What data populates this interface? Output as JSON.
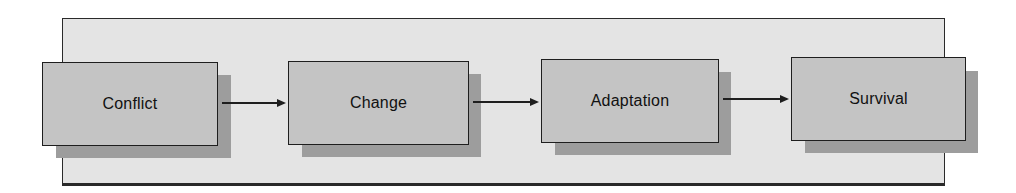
{
  "diagram": {
    "type": "flow",
    "direction": "left-to-right",
    "nodes": [
      {
        "id": "conflict",
        "label": "Conflict"
      },
      {
        "id": "change",
        "label": "Change"
      },
      {
        "id": "adaptation",
        "label": "Adaptation"
      },
      {
        "id": "survival",
        "label": "Survival"
      }
    ],
    "edges": [
      {
        "from": "conflict",
        "to": "change"
      },
      {
        "from": "change",
        "to": "adaptation"
      },
      {
        "from": "adaptation",
        "to": "survival"
      }
    ],
    "colors": {
      "frame_fill": "#e4e4e4",
      "box_fill": "#c4c4c4",
      "shadow_fill": "#9d9d9d",
      "stroke": "#1e1e1e"
    }
  }
}
